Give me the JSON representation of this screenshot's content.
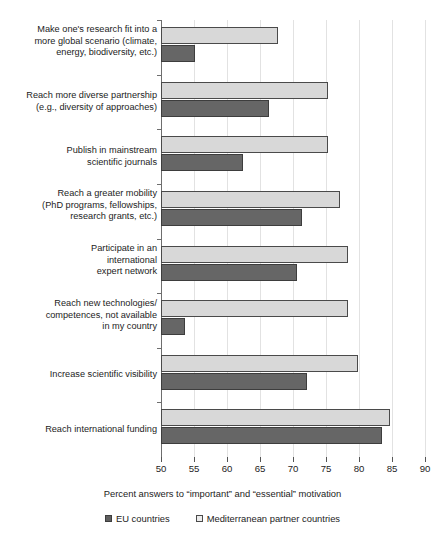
{
  "chart_data": {
    "type": "bar",
    "orientation": "horizontal",
    "title": "",
    "xlabel": "Percent answers to “important” and “essential” motivation",
    "ylabel": "",
    "xlim": [
      50,
      90
    ],
    "xticks": [
      50,
      55,
      60,
      65,
      70,
      75,
      80,
      85,
      90
    ],
    "grid": true,
    "legend_position": "bottom",
    "categories": [
      "Make one's research fit into a\nmore global scenario (climate,\nenergy, biodiversity, etc.)",
      "Reach more diverse partnership\n(e.g., diversity of approaches)",
      "Publish in mainstream\nscientific journals",
      "Reach a greater mobility\n(PhD programs, fellowships,\nresearch grants, etc.)",
      "Participate in an\ninternational\nexpert network",
      "Reach new technologies/\ncompetences, not available\nin my country",
      "Increase scientific visibility",
      "Reach international funding"
    ],
    "series": [
      {
        "name": "EU countries",
        "color": "#666666",
        "values": [
          55.1,
          66.4,
          62.4,
          71.3,
          70.6,
          53.6,
          72.1,
          83.5
        ]
      },
      {
        "name": "Mediterranean partner countries",
        "color": "#d8d8d8",
        "values": [
          67.7,
          75.3,
          75.3,
          77.1,
          78.4,
          78.4,
          79.9,
          84.7
        ]
      }
    ]
  },
  "axis": {
    "tick_labels": [
      "50",
      "55",
      "60",
      "65",
      "70",
      "75",
      "80",
      "85",
      "90"
    ],
    "title": "Percent answers to “important” and “essential” motivation"
  },
  "legend": {
    "items": [
      {
        "label": "EU countries",
        "swatch": "dark-square-icon"
      },
      {
        "label": "Mediterranean partner countries",
        "swatch": "light-square-icon"
      }
    ]
  }
}
